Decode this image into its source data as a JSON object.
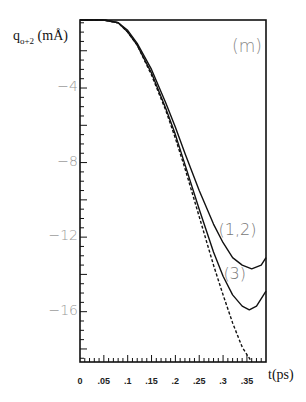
{
  "chart_data": {
    "type": "line",
    "title": "",
    "panel_label": "(m)",
    "xlabel": "t(ps)",
    "ylabel": "q_{o+2} (mÅ)",
    "ylabel_main": "q",
    "ylabel_sub": "o+2",
    "ylabel_unit": " (mÅ)",
    "xlim": [
      0,
      0.39
    ],
    "ylim": [
      -18.7,
      -0.35
    ],
    "x_ticks": [
      "0",
      ".05",
      ".1",
      ".15",
      ".2",
      ".25",
      ".3",
      ".35"
    ],
    "x_tick_values": [
      0,
      0.05,
      0.1,
      0.15,
      0.2,
      0.25,
      0.3,
      0.35
    ],
    "y_ticks": [
      "-4",
      "-8",
      "-12",
      "-16"
    ],
    "y_tick_values": [
      -4,
      -8,
      -12,
      -16
    ],
    "grid": false,
    "series": [
      {
        "name": "(1,2)",
        "style": "solid",
        "x": [
          0,
          0.05,
          0.08,
          0.1,
          0.12,
          0.15,
          0.18,
          0.2,
          0.22,
          0.25,
          0.28,
          0.3,
          0.32,
          0.34,
          0.36,
          0.38,
          0.39
        ],
        "y": [
          -0.35,
          -0.35,
          -0.5,
          -0.9,
          -1.6,
          -3.0,
          -4.8,
          -6.1,
          -7.5,
          -9.5,
          -11.3,
          -12.3,
          -13.1,
          -13.5,
          -13.7,
          -13.5,
          -13.1
        ]
      },
      {
        "name": "(3)",
        "style": "solid",
        "x": [
          0,
          0.05,
          0.08,
          0.1,
          0.12,
          0.15,
          0.18,
          0.2,
          0.22,
          0.25,
          0.28,
          0.3,
          0.32,
          0.34,
          0.355,
          0.37,
          0.39
        ],
        "y": [
          -0.35,
          -0.35,
          -0.5,
          -1.0,
          -1.7,
          -3.2,
          -5.1,
          -6.5,
          -8.1,
          -10.5,
          -12.8,
          -14.1,
          -15.1,
          -15.7,
          -15.9,
          -15.7,
          -14.9
        ]
      },
      {
        "name": "dashed",
        "style": "dashed",
        "x": [
          0,
          0.05,
          0.08,
          0.1,
          0.12,
          0.15,
          0.18,
          0.2,
          0.22,
          0.25,
          0.28,
          0.3,
          0.32,
          0.34,
          0.36
        ],
        "y": [
          -0.35,
          -0.35,
          -0.5,
          -1.0,
          -1.7,
          -3.3,
          -5.2,
          -6.7,
          -8.3,
          -10.9,
          -13.5,
          -15.1,
          -16.6,
          -17.9,
          -18.7
        ]
      }
    ],
    "annotations": [
      {
        "text": "(1,2)",
        "x": 0.32,
        "y": -11.6
      },
      {
        "text": "(3)",
        "x": 0.33,
        "y": -14.0
      },
      {
        "text": "(m)",
        "x": 0.34,
        "y": -2.0
      }
    ]
  }
}
